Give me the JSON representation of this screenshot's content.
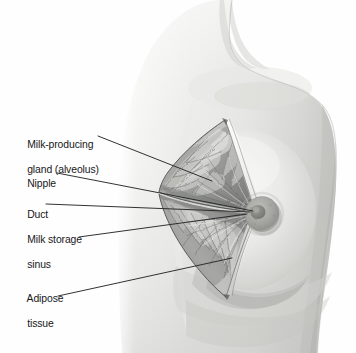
{
  "figure": {
    "kind": "anatomical-illustration",
    "view": "lateral oblique female torso",
    "style": "grayscale pencil / airbrush medical illustration",
    "background_color": "#ffffff",
    "skin_tone_light": "#f2f2f1",
    "skin_tone_mid": "#d8d8d6",
    "skin_tone_shadow": "#b9b9b6",
    "tissue_dark": "#6f7070",
    "tissue_mid": "#a9aaa8",
    "tissue_light": "#e8e8e6",
    "leader_line_color": "#1b1b1d",
    "text_color": "#18181a"
  },
  "labels": [
    {
      "id": "milk-producing-gland",
      "lines": [
        "Milk-producing",
        "gland (alveolus)"
      ],
      "text_x": 16,
      "text_y": 127,
      "leader_start_x": 98,
      "leader_start_y": 136,
      "leader_end_x": 212,
      "leader_end_y": 181
    },
    {
      "id": "nipple",
      "lines": [
        "Nipple"
      ],
      "text_x": 16,
      "text_y": 166,
      "leader_start_x": 57,
      "leader_start_y": 173,
      "leader_end_x": 253,
      "leader_end_y": 211
    },
    {
      "id": "duct",
      "lines": [
        "Duct"
      ],
      "text_x": 16,
      "text_y": 197,
      "leader_start_x": 46,
      "leader_start_y": 204,
      "leader_end_x": 250,
      "leader_end_y": 212
    },
    {
      "id": "milk-storage-sinus",
      "lines": [
        "Milk storage",
        "sinus"
      ],
      "text_x": 16,
      "text_y": 222,
      "leader_start_x": 79,
      "leader_start_y": 237,
      "leader_end_x": 247,
      "leader_end_y": 214
    },
    {
      "id": "adipose-tissue",
      "lines": [
        "Adipose",
        "tissue"
      ],
      "text_x": 16,
      "text_y": 281,
      "leader_start_x": 58,
      "leader_start_y": 296,
      "leader_end_x": 232,
      "leader_end_y": 258
    }
  ],
  "anatomy": {
    "nipple_center_x": 262,
    "nipple_center_y": 214,
    "areola_radius": 17,
    "nipple_radius": 7,
    "wedge_apex_top_x": 225,
    "wedge_apex_top_y": 120,
    "wedge_apex_bottom_x": 226,
    "wedge_apex_bottom_y": 297,
    "wedge_outer_left_x": 159,
    "duct_convergence_x": 256,
    "duct_convergence_y": 212
  }
}
